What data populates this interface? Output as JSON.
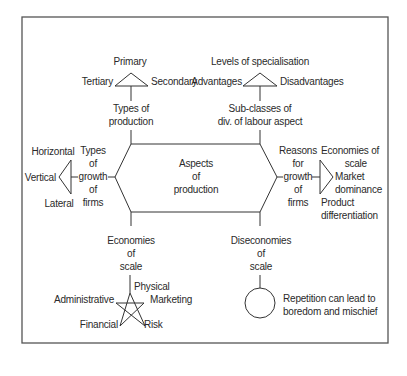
{
  "diagram": {
    "center": {
      "label": "Aspects\nof\nproduction"
    },
    "types_of_production": {
      "label": "Types of\nproduction",
      "items": {
        "top": "Primary",
        "left": "Tertiary",
        "right": "Secondary"
      }
    },
    "division_of_labour": {
      "label": "Sub-classes of\ndiv. of labour aspect",
      "items": {
        "top": "Levels of specialisation",
        "left": "Advantages",
        "right": "Disadvantages"
      }
    },
    "types_of_growth": {
      "label": "Types\nof\ngrowth\nof\nfirms",
      "items": {
        "top": "Horizontal",
        "middle": "Vertical",
        "bottom": "Lateral"
      }
    },
    "reasons_for_growth": {
      "label": "Reasons\nfor\ngrowth\nof\nfirms",
      "items": {
        "top": "Economies of\nscale",
        "middle": "Market\ndominance",
        "bottom": "Product\ndifferentiation"
      }
    },
    "economies_of_scale": {
      "label": "Economies\nof\nscale",
      "items": {
        "top": "Physical",
        "right": "Marketing",
        "left": "Administrative",
        "bottom_left": "Financial",
        "bottom_right": "Risk"
      }
    },
    "diseconomies_of_scale": {
      "label": "Diseconomies\nof\nscale",
      "note": "Repetition can lead to\nboredom and mischief"
    },
    "colors": {
      "line": "#333333",
      "frame": "#555555",
      "text": "#2a2a2a"
    }
  }
}
